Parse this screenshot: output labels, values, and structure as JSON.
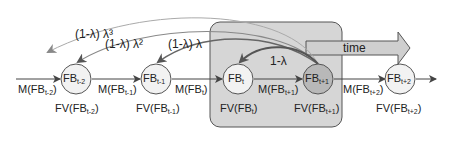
{
  "diagram": {
    "type": "temporal feedback chain",
    "nodes": [
      {
        "id": "FB_t-2",
        "base": "FB",
        "sub": "t-2",
        "fv": "FV(FB",
        "fv_sub": "t-2",
        "fill": "#f2f2f2"
      },
      {
        "id": "FB_t-1",
        "base": "FB",
        "sub": "t-1",
        "fv": "FV(FB",
        "fv_sub": "t-1",
        "fill": "#f2f2f2"
      },
      {
        "id": "FB_t",
        "base": "FB",
        "sub": "t",
        "fv": "FV(FB",
        "fv_sub": "t",
        "fill": "#f2f2f2"
      },
      {
        "id": "FB_t+1",
        "base": "FB",
        "sub": "t+1",
        "fv": "FV(FB",
        "fv_sub": "t+1",
        "fill": "#b8b8b8"
      },
      {
        "id": "FB_t+2",
        "base": "FB",
        "sub": "t+2",
        "fv": "FV(FB",
        "fv_sub": "t+2",
        "fill": "#f2f2f2"
      }
    ],
    "edges": [
      {
        "label": "M(FB",
        "sub": "t-2"
      },
      {
        "label": "M(FB",
        "sub": "t-1"
      },
      {
        "label": "M(FB",
        "sub": "t"
      },
      {
        "label": "M(FB",
        "sub": "t+1"
      },
      {
        "label": "M(FB",
        "sub": "t+2"
      }
    ],
    "feedback_arcs": [
      {
        "label": "1-λ",
        "target": "FB_t"
      },
      {
        "label": "(1-λ) λ",
        "target": "FB_t-1"
      },
      {
        "label": "(1-λ) λ²",
        "target": "FB_t-2"
      },
      {
        "label": "(1-λ) λ³",
        "target": "FB_t-3"
      }
    ],
    "time_arrow": {
      "label": "time"
    },
    "close_paren": ")"
  }
}
